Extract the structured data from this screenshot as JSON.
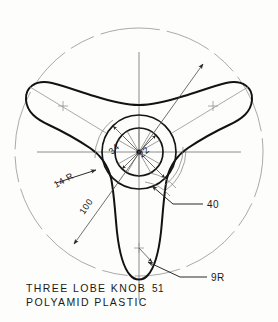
{
  "drawing": {
    "title_line_1": "THREE LOBE KNOB",
    "title_line_2": "POLYAMID PLASTIC",
    "part_number": "51",
    "background_color": "#fdfdfb",
    "ink_color": "#121212",
    "construction_color": "#8d8d8d"
  },
  "dimensions": {
    "outer_circle": "100",
    "hub_outer_dia": "34",
    "bore_dia": "22",
    "lobe_tip_radius": "14 R",
    "fillet_radius": "9R",
    "lobe_width": "40"
  },
  "labels": {
    "d_100": "100",
    "d_34": "34",
    "d_22": "22",
    "d_14r": "14 R",
    "d_9r": "9R",
    "d_40": "40",
    "part_no": "51"
  },
  "geometry": {
    "center_x": 139,
    "center_y": 152,
    "outer_circle_radius": 124,
    "hub_outer_radius": 37,
    "bore_radius": 24,
    "lobe_count": 3,
    "lobe_angles_deg": [
      90,
      210,
      330
    ]
  }
}
